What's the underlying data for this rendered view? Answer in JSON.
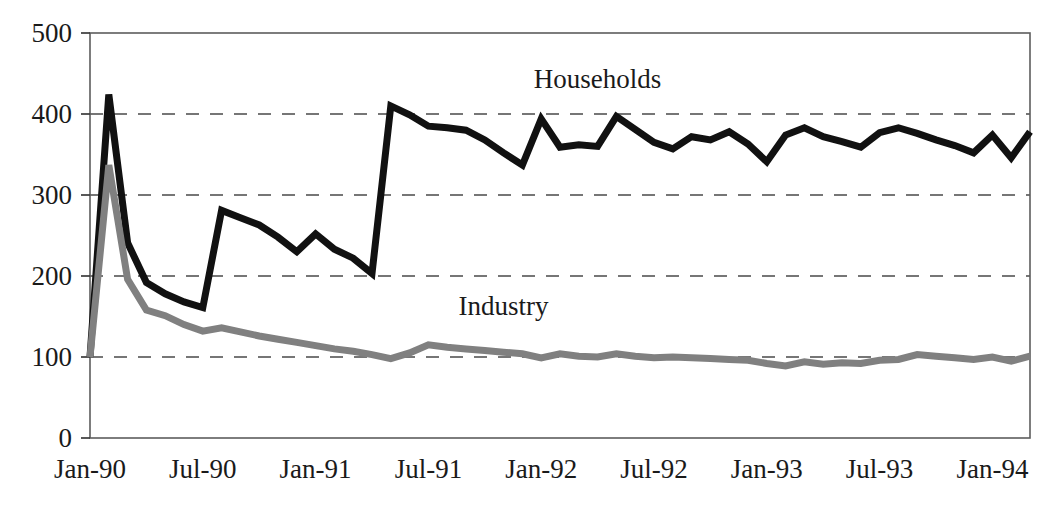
{
  "chart_data": {
    "type": "line",
    "title": "",
    "xlabel": "",
    "ylabel": "",
    "ylim": [
      0,
      500
    ],
    "yticks": [
      0,
      100,
      200,
      300,
      400,
      500
    ],
    "ytick_labels": [
      "0",
      "100",
      "200",
      "300",
      "400",
      "500"
    ],
    "gridlines": [
      100,
      200,
      300,
      400
    ],
    "grid": "horizontal-dashed",
    "legend_position": "inline-annotation",
    "x_tick_labels": [
      "Jan-90",
      "Jul-90",
      "Jan-91",
      "Jul-91",
      "Jan-92",
      "Jul-92",
      "Jan-93",
      "Jul-93",
      "Jan-94"
    ],
    "x_tick_indices": [
      0,
      6,
      12,
      18,
      24,
      30,
      36,
      42,
      48
    ],
    "x": [
      "Jan-90",
      "Feb-90",
      "Mar-90",
      "Apr-90",
      "May-90",
      "Jun-90",
      "Jul-90",
      "Aug-90",
      "Sep-90",
      "Oct-90",
      "Nov-90",
      "Dec-90",
      "Jan-91",
      "Feb-91",
      "Mar-91",
      "Apr-91",
      "May-91",
      "Jun-91",
      "Jul-91",
      "Aug-91",
      "Sep-91",
      "Oct-91",
      "Nov-91",
      "Dec-91",
      "Jan-92",
      "Feb-92",
      "Mar-92",
      "Apr-92",
      "May-92",
      "Jun-92",
      "Jul-92",
      "Aug-92",
      "Sep-92",
      "Oct-92",
      "Nov-92",
      "Dec-92",
      "Jan-93",
      "Feb-93",
      "Mar-93",
      "Apr-93",
      "May-93",
      "Jun-93",
      "Jul-93",
      "Aug-93",
      "Sep-93",
      "Oct-93",
      "Nov-93",
      "Dec-93",
      "Jan-94",
      "Feb-94",
      "Mar-94"
    ],
    "series": [
      {
        "name": "Households",
        "color": "#111111",
        "stroke_width": 7,
        "label_x_index": 27,
        "label_value": 432,
        "values": [
          100,
          424,
          241,
          192,
          178,
          168,
          161,
          281,
          272,
          263,
          248,
          230,
          252,
          233,
          222,
          203,
          410,
          399,
          385,
          383,
          380,
          368,
          352,
          337,
          394,
          359,
          362,
          360,
          397,
          381,
          365,
          357,
          372,
          368,
          378,
          363,
          341,
          374,
          383,
          372,
          366,
          359,
          377,
          383,
          376,
          368,
          361,
          352,
          374,
          346,
          378
        ]
      },
      {
        "name": "Industry",
        "color": "#808080",
        "stroke_width": 7,
        "label_x_index": 22,
        "label_value": 152,
        "values": [
          100,
          337,
          196,
          158,
          151,
          140,
          132,
          136,
          131,
          126,
          122,
          118,
          114,
          110,
          107,
          103,
          98,
          105,
          115,
          112,
          110,
          108,
          106,
          104,
          99,
          104,
          101,
          100,
          104,
          101,
          99,
          100,
          99,
          98,
          97,
          96,
          92,
          89,
          94,
          91,
          93,
          92,
          96,
          97,
          103,
          101,
          99,
          97,
          100,
          95,
          101
        ]
      }
    ]
  }
}
